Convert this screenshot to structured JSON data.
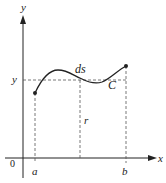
{
  "diagram": {
    "axis_x_label": "x",
    "axis_y_label": "y",
    "origin_label": "0",
    "a_label": "a",
    "b_label": "b",
    "y_level_label": "y",
    "ds_label": "ds",
    "curve_label": "C",
    "r_label": "r",
    "colors": {
      "line": "#222222",
      "dash": "#555555"
    }
  }
}
